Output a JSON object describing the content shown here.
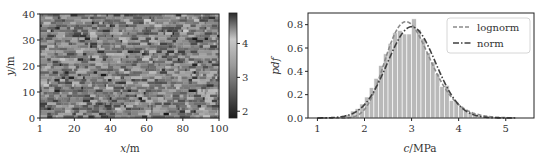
{
  "chart_data": [
    {
      "type": "heatmap",
      "title": "",
      "xlabel": "x/m",
      "ylabel": "y/m",
      "xlim": [
        1,
        100
      ],
      "ylim": [
        0,
        40
      ],
      "xticks": [
        1,
        20,
        40,
        60,
        80,
        100
      ],
      "yticks": [
        0,
        10,
        20,
        30,
        40
      ],
      "grid": false,
      "colormap": "gray",
      "colorbar": {
        "ticks": [
          2,
          3,
          4
        ],
        "range": [
          1.8,
          4.9
        ]
      },
      "grid_cols": 100,
      "grid_rows": 40,
      "value_mean": 3.0,
      "value_std": 0.5,
      "seed": 7
    },
    {
      "type": "bar",
      "subtype": "histogram_with_fits",
      "title": "",
      "xlabel": "c/MPa",
      "ylabel": "pdf",
      "xlim": [
        0.8,
        5.6
      ],
      "ylim": [
        0,
        0.9
      ],
      "xticks": [
        1,
        2,
        3,
        4,
        5
      ],
      "yticks": [
        0.0,
        0.2,
        0.4,
        0.6,
        0.8
      ],
      "ytick_labels": [
        "0.0",
        "0.2",
        "0.4",
        "0.6",
        "0.8"
      ],
      "grid": false,
      "legend_position": "upper right",
      "bin_width": 0.1,
      "bin_starts": [
        1.4,
        1.5,
        1.6,
        1.7,
        1.8,
        1.9,
        2.0,
        2.1,
        2.2,
        2.3,
        2.4,
        2.5,
        2.6,
        2.7,
        2.8,
        2.9,
        3.0,
        3.1,
        3.2,
        3.3,
        3.4,
        3.5,
        3.6,
        3.7,
        3.8,
        3.9,
        4.0,
        4.1,
        4.2,
        4.3,
        4.4,
        4.5,
        4.6,
        4.7
      ],
      "values": [
        0.01,
        0.02,
        0.03,
        0.06,
        0.08,
        0.12,
        0.18,
        0.26,
        0.34,
        0.45,
        0.55,
        0.64,
        0.73,
        0.75,
        0.72,
        0.72,
        0.85,
        0.76,
        0.68,
        0.56,
        0.48,
        0.38,
        0.27,
        0.28,
        0.15,
        0.14,
        0.1,
        0.07,
        0.05,
        0.03,
        0.02,
        0.01,
        0.01,
        0.005
      ],
      "series": [
        {
          "name": "lognorm",
          "style": "dashed",
          "mu": 3.0,
          "sigma": 0.5,
          "color": "#888888"
        },
        {
          "name": "norm",
          "style": "dashdot",
          "mu": 3.0,
          "sigma": 0.51,
          "color": "#444444"
        }
      ]
    }
  ],
  "heatmap": {
    "xlabel": "x/m",
    "ylabel": "y/m",
    "xtick_labels": [
      "1",
      "20",
      "40",
      "60",
      "80",
      "100"
    ],
    "ytick_labels": [
      "0",
      "10",
      "20",
      "30",
      "40"
    ],
    "colorbar_tick_labels": [
      "2",
      "3",
      "4"
    ]
  },
  "histogram": {
    "xlabel": "c/MPa",
    "ylabel": "pdf",
    "xtick_labels": [
      "1",
      "2",
      "3",
      "4",
      "5"
    ],
    "ytick_labels": [
      "0.0",
      "0.2",
      "0.4",
      "0.6",
      "0.8"
    ],
    "legend": [
      {
        "label": "lognorm"
      },
      {
        "label": "norm"
      }
    ]
  },
  "colors": {
    "bar_fill": "#b9b9b9",
    "bar_edge": "#ffffff",
    "axis": "#222222",
    "lognorm": "#8a8a8a",
    "norm": "#404040"
  }
}
